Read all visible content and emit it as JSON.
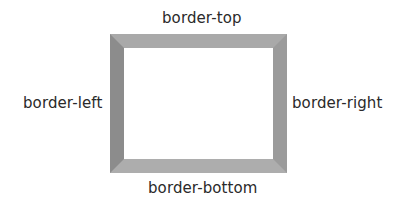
{
  "diagram": {
    "labels": {
      "top": "border-top",
      "left": "border-left",
      "right": "border-right",
      "bottom": "border-bottom"
    },
    "box": {
      "border_width_px": 14,
      "colors": {
        "top": "#a9a9a9",
        "left": "#8c8c8c",
        "right": "#9b9b9b",
        "bottom": "#adadad",
        "fill": "#ffffff"
      }
    }
  }
}
